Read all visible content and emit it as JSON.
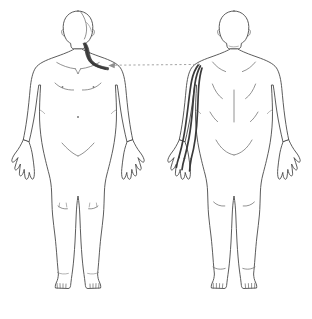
{
  "chart": {
    "type": "body-map",
    "background_color": "#ffffff",
    "width": 312,
    "height": 319,
    "outline_color": "#4a4a4a",
    "detail_color": "#6d6d6d",
    "highlight_color": "#3a3a3a",
    "leader_color": "#9a9a9a"
  },
  "figures": [
    {
      "id": "anterior",
      "view_label": "Anterior",
      "position": "left",
      "sex_presentation": "neutral",
      "center_x": 78,
      "details": [
        "hair-parting",
        "clavicles",
        "nipples",
        "navel",
        "knee-creases",
        "elbow-creases",
        "ankle-lines",
        "toes"
      ]
    },
    {
      "id": "posterior",
      "view_label": "Posterior",
      "position": "right",
      "sex_presentation": "neutral",
      "center_x": 234,
      "details": [
        "scapulae",
        "spine-line",
        "gluteal-crease",
        "knee-backs",
        "heel-lines",
        "toes"
      ]
    }
  ],
  "annotations": {
    "marked_regions": [
      {
        "id": "region-neck-shoulder",
        "figure": "anterior",
        "label": "Right neck and shoulder",
        "side": "right",
        "shape": "band",
        "color": "#3a3a3a"
      },
      {
        "id": "region-arm",
        "figure": "posterior",
        "label": "Right arm posterior stripe",
        "side": "right",
        "shape": "stripe",
        "color": "#3a3a3a"
      }
    ],
    "leader": {
      "id": "leader-arrow",
      "label": "Referral arrow",
      "style": "dashed",
      "direction": "right-to-left",
      "from_x": 200,
      "from_y": 64,
      "to_x": 109,
      "to_y": 65,
      "color": "#9a9a9a"
    }
  }
}
